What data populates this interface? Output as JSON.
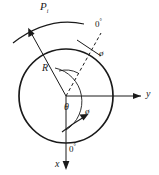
{
  "figure": {
    "type": "engineering-cross-section-diagram",
    "stroke_color": "#1a1a1a",
    "background_color": "#ffffff"
  },
  "labels": {
    "pressure": {
      "symbol": "P",
      "subscript": "i",
      "text": "P"
    },
    "radius": {
      "text": "R"
    },
    "theta": {
      "text": "θ"
    },
    "phi_outer": {
      "text": "ø"
    },
    "phi_inner": {
      "text": "ø"
    },
    "zero_top": {
      "number": "0",
      "unit": "°"
    },
    "zero_bottom": {
      "number": "0",
      "unit": "°"
    },
    "axis_y": {
      "text": "y"
    },
    "axis_x": {
      "text": "x"
    }
  },
  "geometry": {
    "circle": {
      "cx": 66,
      "cy": 96,
      "r": 47
    },
    "center_point": {
      "x": 66,
      "y": 96
    },
    "y_axis": {
      "from_x": 66,
      "to_x": 146,
      "y": 96,
      "direction": "right"
    },
    "x_axis": {
      "x": 66,
      "from_y": 96,
      "to_y": 168,
      "direction": "down"
    },
    "radius_line_angle_deg": 215,
    "dashed_line_angle_deg": 302,
    "theta_arc_label": "θ",
    "rotation_arrow": "counter-clockwise-to-clockwise indicator"
  }
}
